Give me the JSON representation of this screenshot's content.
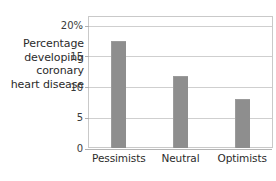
{
  "chart_data": {
    "type": "bar",
    "title": "",
    "subtitle": "",
    "xlabel": "",
    "ylabel": "Percentage developing coronary heart disease",
    "ylabel_lines": [
      "Percentage",
      "developing",
      "coronary",
      "heart disease"
    ],
    "categories": [
      "Pessimists",
      "Neutral",
      "Optimists"
    ],
    "values": [
      17.5,
      11.8,
      8.0
    ],
    "ylim": [
      0,
      21.5
    ],
    "yticks": [
      0,
      5,
      10,
      15,
      20
    ],
    "ytick_labels": [
      "0",
      "5",
      "10",
      "15",
      "20%"
    ],
    "grid": true,
    "legend": "none",
    "bar_color": "#8e8e8e",
    "gridline_color": "#cfcfcf",
    "frame_color": "#c9c9c9",
    "background_color": "#ffffff",
    "text_color": "#2b2b2b"
  }
}
